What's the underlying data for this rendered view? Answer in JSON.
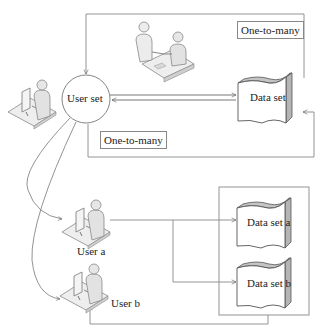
{
  "diagram": {
    "nodes": {
      "user_set": "User set",
      "data_set": "Data set",
      "user_a": "User a",
      "user_b": "User b",
      "data_set_a": "Data set a",
      "data_set_b": "Data set b"
    },
    "labels": {
      "top_relation": "One-to-many",
      "middle_relation": "One-to-many"
    },
    "icons": {
      "user_set_workstation": "person-at-computer-icon",
      "meeting": "two-people-at-table-icon",
      "user_a_workstation": "person-at-computer-icon",
      "user_b_workstation": "person-at-computer-icon"
    },
    "colors": {
      "line": "#777777",
      "doc_shade": "#b5b5b5",
      "figure_fill": "#e6e6e6"
    }
  }
}
